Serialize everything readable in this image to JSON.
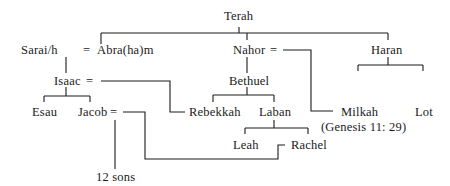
{
  "diagram": {
    "type": "family-tree",
    "nodes": {
      "terah": "Terah",
      "sarai": "Sarai/h",
      "eq1": "=",
      "abraham": "Abra(ha)m",
      "nahor": "Nahor",
      "eq2": "=",
      "haran": "Haran",
      "isaac": "Isaac",
      "eq3": "=",
      "bethuel": "Bethuel",
      "milkah": "Milkah",
      "milkah_note": "(Genesis 11: 29)",
      "lot": "Lot",
      "esau": "Esau",
      "jacob": "Jacob",
      "eq4": "=",
      "rebekkah": "Rebekkah",
      "laban": "Laban",
      "leah": "Leah",
      "rachel": "Rachel",
      "sons": "12 sons"
    },
    "relations": [
      {
        "parent": "Terah",
        "children": [
          "Abra(ha)m",
          "Nahor",
          "Haran"
        ]
      },
      {
        "marriage": [
          "Sarai/h",
          "Abra(ha)m"
        ],
        "children": [
          "Isaac"
        ]
      },
      {
        "marriage": [
          "Nahor",
          "Milkah"
        ],
        "children": [
          "Bethuel"
        ]
      },
      {
        "parent": "Haran",
        "children": [
          "Milkah",
          "Lot"
        ]
      },
      {
        "marriage": [
          "Isaac",
          "Rebekkah"
        ],
        "children": [
          "Esau",
          "Jacob"
        ]
      },
      {
        "parent": "Bethuel",
        "children": [
          "Rebekkah",
          "Laban"
        ]
      },
      {
        "parent": "Laban",
        "children": [
          "Leah",
          "Rachel"
        ]
      },
      {
        "marriage": [
          "Jacob",
          "Leah",
          "Rachel"
        ],
        "children": [
          "12 sons"
        ]
      }
    ]
  }
}
